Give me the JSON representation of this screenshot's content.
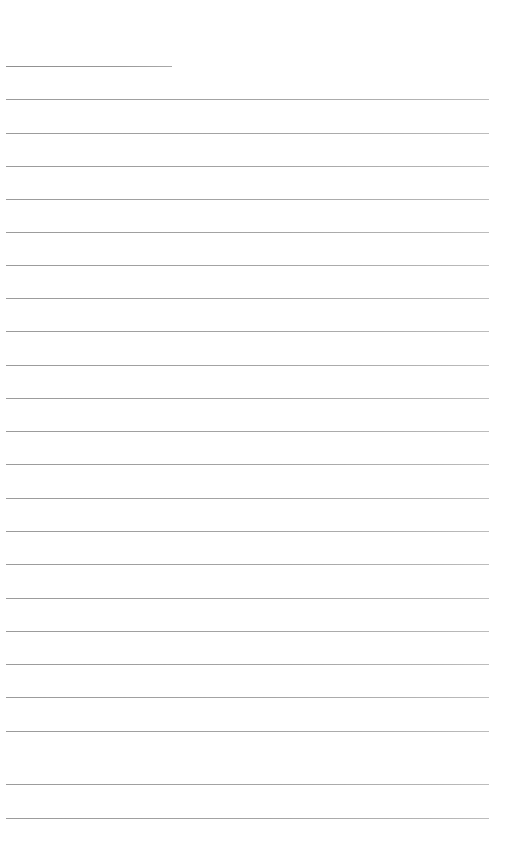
{
  "page": {
    "kind": "ruled-paper",
    "width": 512,
    "height": 850,
    "background_color": "#ffffff",
    "content_text": "",
    "is_blank": true
  },
  "ruling": {
    "line_color": "#a5a5a5",
    "line_thickness": 1,
    "line_spacing": 33.3,
    "first_line_y": 66,
    "last_line_y": 818,
    "left_margin": 6,
    "right_margin": 489,
    "line_count": 23,
    "lines": [
      {
        "index": 0,
        "y": 66,
        "x1": 6,
        "x2": 172,
        "short": true
      },
      {
        "index": 1,
        "y": 99,
        "x1": 6,
        "x2": 489,
        "short": false
      },
      {
        "index": 2,
        "y": 133,
        "x1": 6,
        "x2": 489,
        "short": false
      },
      {
        "index": 3,
        "y": 166,
        "x1": 6,
        "x2": 489,
        "short": false
      },
      {
        "index": 4,
        "y": 199,
        "x1": 6,
        "x2": 489,
        "short": false
      },
      {
        "index": 5,
        "y": 232,
        "x1": 6,
        "x2": 489,
        "short": false
      },
      {
        "index": 6,
        "y": 265,
        "x1": 6,
        "x2": 489,
        "short": false
      },
      {
        "index": 7,
        "y": 298,
        "x1": 6,
        "x2": 489,
        "short": false
      },
      {
        "index": 8,
        "y": 331,
        "x1": 6,
        "x2": 489,
        "short": false
      },
      {
        "index": 9,
        "y": 365,
        "x1": 6,
        "x2": 489,
        "short": false
      },
      {
        "index": 10,
        "y": 398,
        "x1": 6,
        "x2": 489,
        "short": false
      },
      {
        "index": 11,
        "y": 431,
        "x1": 6,
        "x2": 489,
        "short": false
      },
      {
        "index": 12,
        "y": 464,
        "x1": 6,
        "x2": 489,
        "short": false
      },
      {
        "index": 13,
        "y": 498,
        "x1": 6,
        "x2": 489,
        "short": false
      },
      {
        "index": 14,
        "y": 531,
        "x1": 6,
        "x2": 489,
        "short": false
      },
      {
        "index": 15,
        "y": 564,
        "x1": 6,
        "x2": 489,
        "short": false
      },
      {
        "index": 16,
        "y": 598,
        "x1": 6,
        "x2": 489,
        "short": false
      },
      {
        "index": 17,
        "y": 631,
        "x1": 6,
        "x2": 489,
        "short": false
      },
      {
        "index": 18,
        "y": 664,
        "x1": 6,
        "x2": 489,
        "short": false
      },
      {
        "index": 19,
        "y": 697,
        "x1": 6,
        "x2": 489,
        "short": false
      },
      {
        "index": 20,
        "y": 731,
        "x1": 6,
        "x2": 489,
        "short": false
      },
      {
        "index": 21,
        "y": 784,
        "x1": 6,
        "x2": 489,
        "short": false
      },
      {
        "index": 22,
        "y": 818,
        "x1": 6,
        "x2": 489,
        "short": false
      }
    ]
  }
}
